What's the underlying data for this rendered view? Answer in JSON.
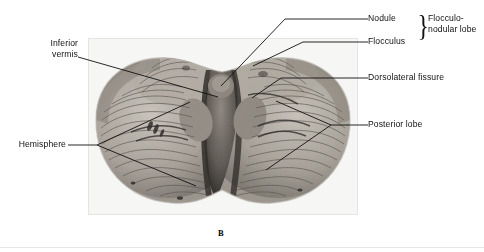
{
  "figure": {
    "caption": "B",
    "image_alt": "inferior-view-cerebellum-photograph",
    "photo": {
      "x": 88,
      "y": 38,
      "width": 270,
      "height": 177,
      "background": "#f2f1ef"
    }
  },
  "labels": {
    "inferior_vermis_line1": "Inferior",
    "inferior_vermis_line2": "vermis",
    "hemisphere": "Hemisphere",
    "nodule": "Nodule",
    "flocculus": "Flocculus",
    "flocculonodular_line1": "Flocculo-",
    "flocculonodular_line2": "nodular lobe",
    "dorsolateral_fissure": "Dorsolateral fissure",
    "posterior_lobe": "Posterior lobe"
  },
  "colors": {
    "leader_line": "#111111",
    "text": "#111111",
    "page_background": "#ffffff",
    "photo_light": "#cdc9c2",
    "photo_mid": "#9a948c",
    "photo_dark": "#3a3733"
  }
}
